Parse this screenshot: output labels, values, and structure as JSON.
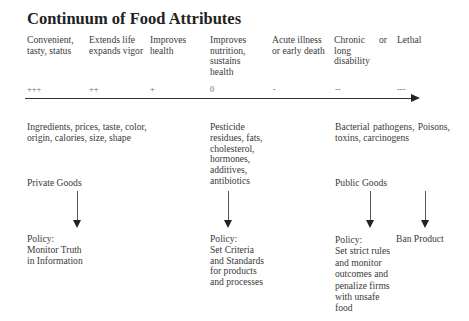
{
  "title": "Continuum of Food Attributes",
  "header": {
    "col1": "Convenient, tasty, status",
    "col2": "Extends life expands vigor",
    "col3": "Improves health",
    "col4": "Improves nutrition, sustains health",
    "col5": "Acute illness or early death",
    "col6": "Chronic long disability",
    "col6_or": "or",
    "col7": "Lethal"
  },
  "scale": {
    "s1": "+++",
    "s2": "++",
    "s3": "+",
    "s4": "0",
    "s5": "-",
    "s6": "--",
    "s7": "---"
  },
  "attributes": {
    "private": "Ingredients, prices, taste, color, origin, calories, size, shape",
    "middle": "Pesticide residues, fats, cholesterol, hormones, additives, antibiotics",
    "public": "Bacterial pathogens, Poisons, toxins, carcinogens"
  },
  "goods": {
    "private": "Private Goods",
    "public": "Public Goods"
  },
  "policy": {
    "private_label": "Policy:",
    "private_text": "Monitor Truth in Information",
    "middle_label": "Policy:",
    "middle_text": "Set Criteria and Standards for products and processes",
    "public_label": "Policy:",
    "public_text": "Set strict rules and monitor outcomes and penalize firms with unsafe food",
    "ban": "Ban Product"
  }
}
